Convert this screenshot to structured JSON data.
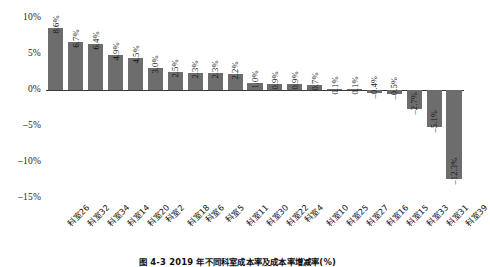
{
  "chart_data": {
    "type": "bar",
    "title": "",
    "caption": "图 4-3  2019 年不同科室成本率及成本率增减率(%)",
    "xlabel": "",
    "ylabel": "",
    "ylim": [
      -15,
      10
    ],
    "yticks": [
      "10%",
      "5%",
      "0%",
      "-5%",
      "-10%",
      "-15%"
    ],
    "ytick_values": [
      10,
      5,
      0,
      -5,
      -10,
      -15
    ],
    "grid": false,
    "legend": "none",
    "bar_color": "#6d6d6d",
    "categories": [
      "科室26",
      "科室32",
      "科室34",
      "科室14",
      "科室20",
      "科室2",
      "科室18",
      "科室6",
      "科室5",
      "科室11",
      "科室30",
      "科室22",
      "科室4",
      "科室10",
      "科室25",
      "科室27",
      "科室16",
      "科室15",
      "科室33",
      "科室31",
      "科室39"
    ],
    "values": [
      8.6,
      6.7,
      6.4,
      4.9,
      4.5,
      3.0,
      2.5,
      2.3,
      2.3,
      2.2,
      1.0,
      0.9,
      0.9,
      0.7,
      0.1,
      0.1,
      -0.4,
      -0.5,
      -2.7,
      -5.1,
      -12.3
    ],
    "value_labels": [
      "8.6%",
      "6.7%",
      "6.4%",
      "4.9%",
      "4.5%",
      "3.0%",
      "2.5%",
      "2.3%",
      "2.3%",
      "2.2%",
      "1.0%",
      "0.9%",
      "0.9%",
      "0.7%",
      "0.1%",
      "0.1%",
      "-0.4%",
      "-0.5%",
      "-2.7%",
      "-5.1%",
      "-12.3%"
    ]
  }
}
